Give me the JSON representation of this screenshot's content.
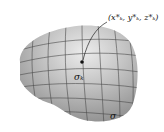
{
  "figure": {
    "type": "surface-partition-diagram",
    "labels": {
      "sample_point": "(x*ₖ, y*ₖ, z*ₖ)",
      "patch": "σₖ",
      "surface": "σ"
    },
    "colors": {
      "surface_light": "#e4e4e4",
      "surface_mid": "#bdbdbd",
      "surface_dark": "#8c8c8c",
      "grid": "#4a4a4a",
      "point": "#111111"
    }
  }
}
